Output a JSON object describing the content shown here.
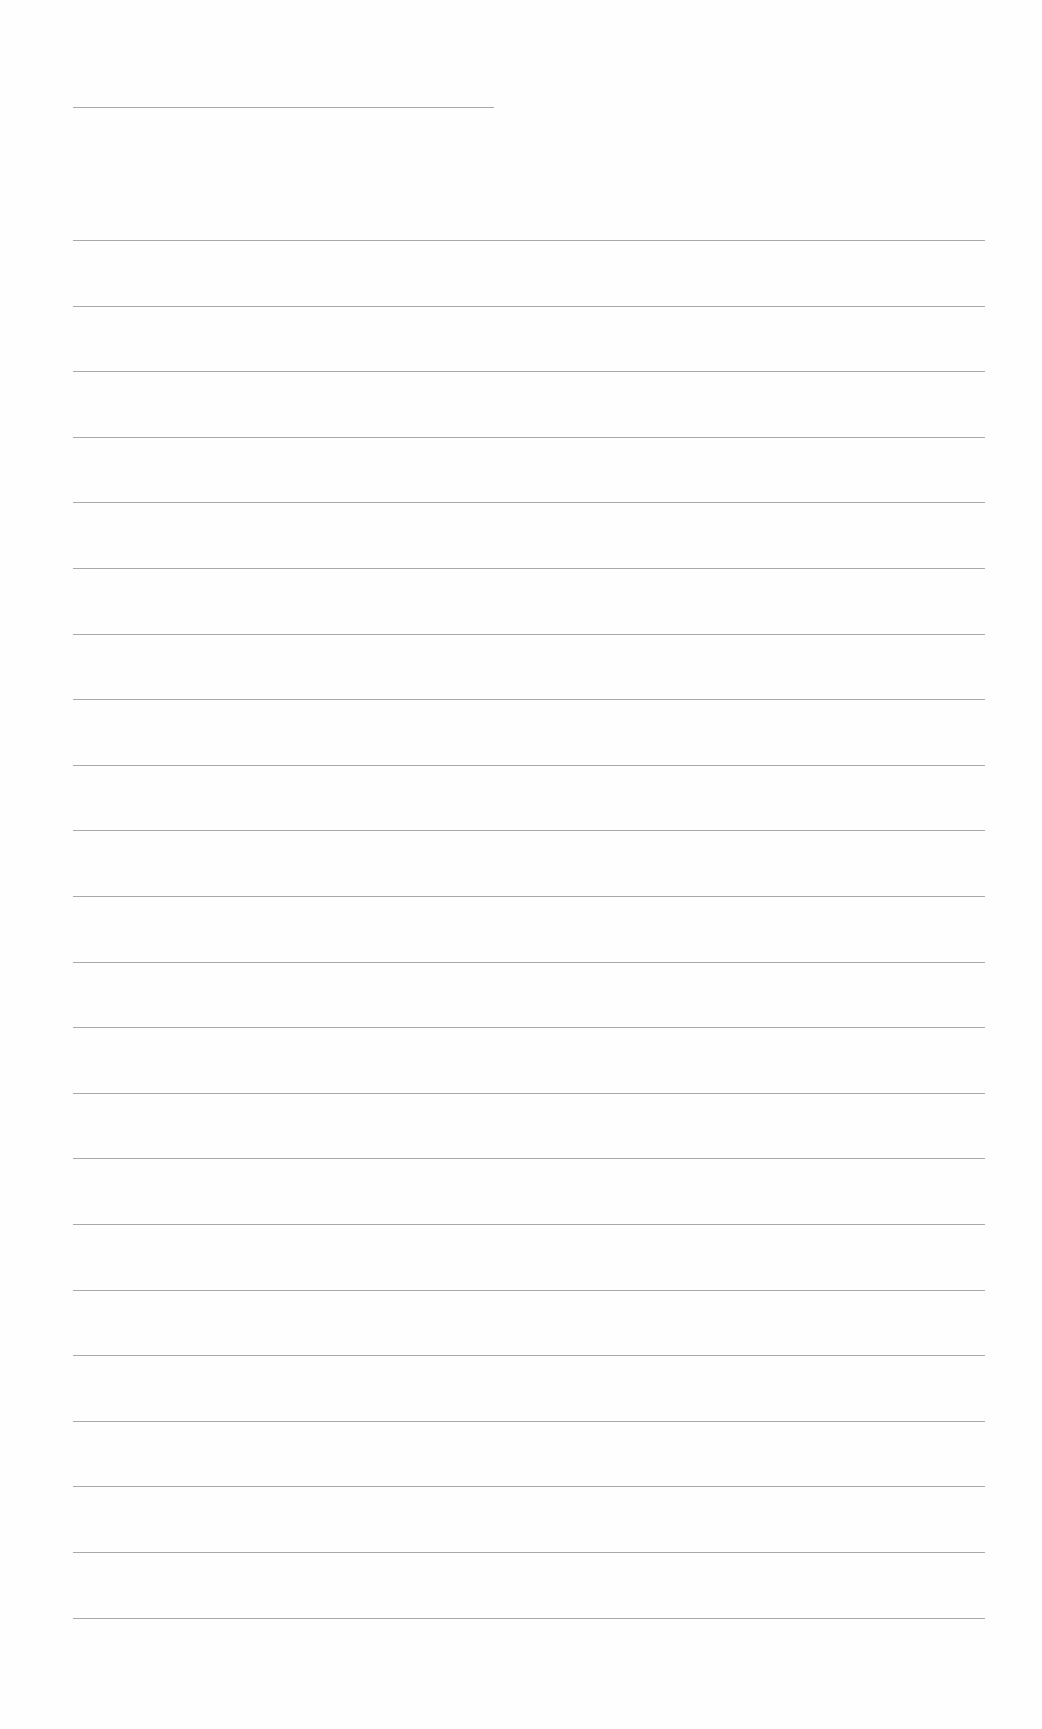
{
  "document": {
    "type": "lined-paper",
    "background_color": "#ffffff",
    "line_color": "#9a9a9a",
    "title_line": {
      "x": 73,
      "y": 107,
      "width": 421
    },
    "ruled_lines": {
      "count": 22,
      "x": 73,
      "width": 912,
      "start_y": 240,
      "spacing": 65.6
    }
  }
}
